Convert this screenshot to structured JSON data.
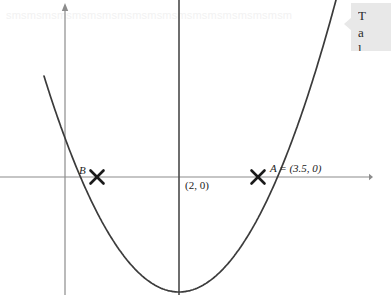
{
  "canvas": {
    "width": 374,
    "height": 295,
    "background": "#ffffff"
  },
  "watermark": {
    "text": "smsmsmsmsmsmsmsmsmsmsmsmsmsmsmsmsmsmsm",
    "color": "#f2f2f2"
  },
  "callout": {
    "line1": "T",
    "line2": "a",
    "line3": "l",
    "background": "#e8e8e8"
  },
  "labels": {
    "point_b": "B",
    "vertex": "(2, 0)",
    "point_a": "A = (3.5, 0)"
  },
  "colors": {
    "axis": "#8c8c8c",
    "curve": "#3b3b3b",
    "symmetry_line": "#4a4a4a",
    "marker": "#1a1a1a",
    "text": "#1c1c1c"
  },
  "chart_data": {
    "type": "line",
    "title": "",
    "xlabel": "",
    "ylabel": "",
    "grid": false,
    "legend": false,
    "axes": {
      "x_axis_pixel_y": 177,
      "y_axis_pixel_x": 65,
      "x_axis_arrow": "right",
      "y_axis_arrow": "up"
    },
    "series": [
      {
        "name": "parabola",
        "kind": "quadratic",
        "vertex": [
          2,
          -1.3
        ],
        "roots": [
          0.5,
          3.5
        ],
        "pixel_vertex": [
          179,
          292
        ],
        "pixel_points": [
          [
            46,
            0
          ],
          [
            56,
            30
          ],
          [
            66,
            58
          ],
          [
            76,
            85
          ],
          [
            86,
            112
          ],
          [
            97,
            177
          ],
          [
            110,
            205
          ],
          [
            125,
            235
          ],
          [
            140,
            258
          ],
          [
            155,
            275
          ],
          [
            167,
            286
          ],
          [
            179,
            292
          ],
          [
            191,
            287
          ],
          [
            205,
            275
          ],
          [
            220,
            257
          ],
          [
            235,
            234
          ],
          [
            248,
            208
          ],
          [
            258,
            177
          ],
          [
            272,
            140
          ],
          [
            285,
            105
          ],
          [
            300,
            70
          ],
          [
            315,
            38
          ],
          [
            330,
            10
          ],
          [
            336,
            0
          ]
        ]
      }
    ],
    "markers": [
      {
        "label": "B",
        "pixel": [
          97,
          177
        ],
        "value": [
          0.5,
          0
        ],
        "style": "x-cross"
      },
      {
        "label": "A = (3.5, 0)",
        "pixel": [
          258,
          177
        ],
        "value": [
          3.5,
          0
        ],
        "style": "x-cross"
      }
    ],
    "annotations": [
      {
        "text": "B",
        "pixel": [
          82,
          172
        ]
      },
      {
        "text": "(2, 0)",
        "pixel": [
          186,
          188
        ]
      },
      {
        "text": "A = (3.5, 0)",
        "pixel": [
          272,
          170
        ]
      }
    ],
    "reference_lines": [
      {
        "name": "axis-of-symmetry",
        "orientation": "vertical",
        "pixel_x": 179,
        "value_x": 2
      }
    ]
  }
}
